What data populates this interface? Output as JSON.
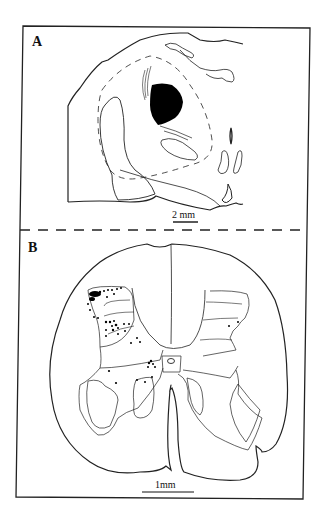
{
  "figure": {
    "panels": [
      {
        "label": "A",
        "scale_bar": "2 mm"
      },
      {
        "label": "B",
        "scale_bar": "1mm"
      }
    ]
  }
}
